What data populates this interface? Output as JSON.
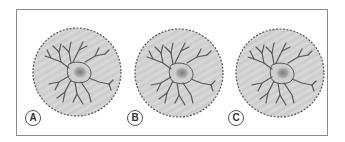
{
  "figure": {
    "panels": [
      {
        "label": "A",
        "cx": 77,
        "cy": 72,
        "r": 44,
        "label_x": 25,
        "label_y": 110
      },
      {
        "label": "B",
        "cx": 179,
        "cy": 73,
        "r": 44,
        "label_x": 127,
        "label_y": 110
      },
      {
        "label": "C",
        "cx": 280,
        "cy": 73,
        "r": 44,
        "label_x": 228,
        "label_y": 110
      }
    ],
    "colors": {
      "disc_fill": "#d4d4d4",
      "disc_edge": "#555555",
      "neuron": "#5a5a5a",
      "nucleus": "#8c8c8c",
      "frame": "#8a8a8a"
    }
  }
}
